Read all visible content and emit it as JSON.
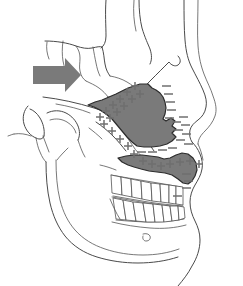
{
  "figure": {
    "title": "Lateral cephalometric tracing",
    "view": "lateral-right-facing",
    "background_color": "#ffffff"
  },
  "colors": {
    "shade_fill": "#7a7a7a",
    "shade_stroke": "#2c2c2c",
    "arrow_fill": "#7a7a7a",
    "line_stroke": "#4a4a4a",
    "plus_color": "#6f6f6f",
    "minus_color": "#6f6f6f"
  },
  "annotations": {
    "force_arrow": {
      "label": "force-direction-arrow",
      "direction": "right",
      "x": 33,
      "y": 58,
      "width": 48,
      "height": 34,
      "color": "#7a7a7a"
    },
    "shaded_regions": [
      {
        "label": "maxilla-shaded-region",
        "name": "upper-shaded-zone",
        "fill": "#7a7a7a"
      },
      {
        "label": "palate-shaded-region",
        "name": "lower-shaded-zone",
        "fill": "#7a7a7a"
      }
    ],
    "plus_symbols": {
      "label": "apposition-plus-markers",
      "glyph": "+",
      "count": 23,
      "meaning": "bone apposition",
      "points": [
        [
          135,
          86
        ],
        [
          127,
          92
        ],
        [
          140,
          94
        ],
        [
          132,
          99
        ],
        [
          120,
          99
        ],
        [
          124,
          106
        ],
        [
          113,
          105
        ],
        [
          117,
          112
        ],
        [
          106,
          111
        ],
        [
          110,
          118
        ],
        [
          100,
          117
        ],
        [
          104,
          124
        ],
        [
          112,
          131
        ],
        [
          120,
          139
        ],
        [
          128,
          146
        ],
        [
          134,
          154
        ],
        [
          143,
          160
        ],
        [
          152,
          163
        ],
        [
          161,
          165
        ],
        [
          170,
          163
        ],
        [
          180,
          161
        ],
        [
          190,
          160
        ],
        [
          199,
          163
        ]
      ]
    },
    "minus_symbols": {
      "label": "resorption-minus-markers",
      "glyph": "–",
      "count": 20,
      "meaning": "bone resorption",
      "points": [
        [
          166,
          86
        ],
        [
          168,
          94
        ],
        [
          170,
          102
        ],
        [
          171,
          110
        ],
        [
          169,
          118
        ],
        [
          176,
          122
        ],
        [
          182,
          117
        ],
        [
          185,
          125
        ],
        [
          178,
          130
        ],
        [
          186,
          134
        ],
        [
          180,
          140
        ],
        [
          188,
          144
        ],
        [
          172,
          148
        ],
        [
          162,
          150
        ],
        [
          152,
          152
        ],
        [
          141,
          152
        ],
        [
          186,
          174
        ],
        [
          188,
          181
        ],
        [
          186,
          188
        ],
        [
          177,
          196
        ]
      ]
    }
  },
  "structures": [
    {
      "name": "cranial-vault-outline"
    },
    {
      "name": "frontal-bone-outline"
    },
    {
      "name": "sella-turcica-outline"
    },
    {
      "name": "cranial-base-line"
    },
    {
      "name": "zygomatic-arch-line"
    },
    {
      "name": "orbit-outline"
    },
    {
      "name": "nasal-bone-outline"
    },
    {
      "name": "soft-tissue-profile"
    },
    {
      "name": "maxilla-outline"
    },
    {
      "name": "mandible-outline"
    },
    {
      "name": "mental-foramen"
    },
    {
      "name": "upper-dentition"
    },
    {
      "name": "lower-dentition"
    },
    {
      "name": "external-auditory-meatus"
    },
    {
      "name": "occipital-outline"
    }
  ],
  "dentition": {
    "upper_teeth_count": 8,
    "lower_teeth_count": 8,
    "upper_label": "upper-arch",
    "lower_label": "lower-arch"
  }
}
